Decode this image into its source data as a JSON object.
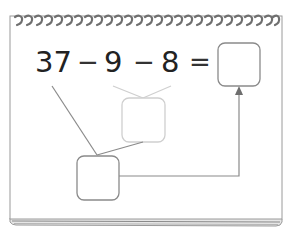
{
  "worksheet": {
    "equation": {
      "terms": [
        "37",
        "9",
        "8"
      ],
      "operators": [
        "−",
        "−",
        "="
      ],
      "answer_box": ""
    },
    "diagram": {
      "intermediate_box": "",
      "faded_box": "",
      "connectors": [
        {
          "from": "37",
          "to": "lower-box"
        },
        {
          "from": "9",
          "to": "faded-box"
        },
        {
          "from": "8",
          "to": "faded-box"
        },
        {
          "from": "faded-box",
          "to": "lower-box"
        },
        {
          "from": "lower-box",
          "to": "answer-box",
          "arrow": true
        }
      ]
    },
    "colors": {
      "line": "#8a8a8a",
      "faded_line": "#cccccc",
      "text": "#222222",
      "frame": "#999999",
      "spiral": "#777777"
    }
  }
}
